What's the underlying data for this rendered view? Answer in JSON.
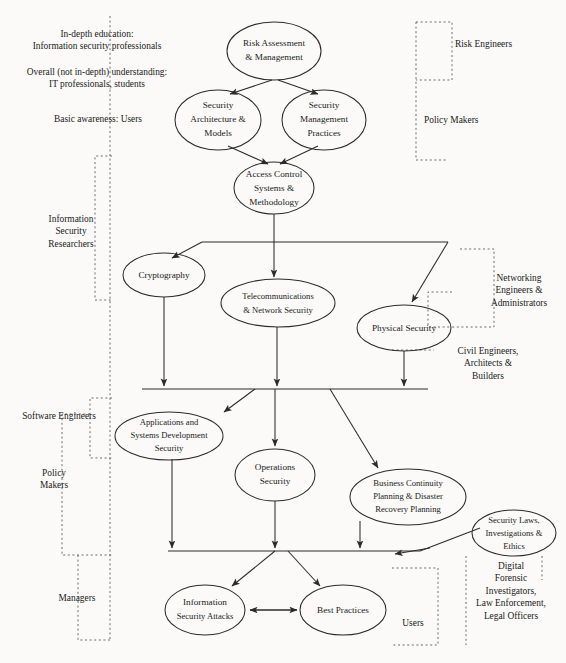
{
  "diagram": {
    "type": "directed-graph-with-audience-brackets",
    "node_fill": "#ffffff",
    "node_stroke": "#2b2b2b",
    "bracket_stroke": "#6b6b6b",
    "background": "#fbfaf8",
    "nodes": [
      {
        "id": "risk",
        "label": "Risk Assessment\n& Management",
        "cx": 274,
        "cy": 51,
        "rx": 47,
        "ry": 29
      },
      {
        "id": "arch",
        "label": "Security\nArchitecture &\nModels",
        "cx": 218,
        "cy": 120,
        "rx": 43,
        "ry": 30
      },
      {
        "id": "mgmt",
        "label": "Security\nManagement\nPractices",
        "cx": 324,
        "cy": 120,
        "rx": 42,
        "ry": 30
      },
      {
        "id": "access",
        "label": "Access Control\nSystems &\nMethodology",
        "cx": 274,
        "cy": 188,
        "rx": 40,
        "ry": 26
      },
      {
        "id": "crypto",
        "label": "Cryptography",
        "cx": 164,
        "cy": 275,
        "rx": 41,
        "ry": 22
      },
      {
        "id": "telecom",
        "label": "Telecommunications\n& Network Security",
        "cx": 278,
        "cy": 303,
        "rx": 57,
        "ry": 24
      },
      {
        "id": "physical",
        "label": "Physical Security",
        "cx": 404,
        "cy": 328,
        "rx": 47,
        "ry": 23
      },
      {
        "id": "appdev",
        "label": "Applications and\nSystems Development\nSecurity",
        "cx": 169,
        "cy": 436,
        "rx": 54,
        "ry": 24
      },
      {
        "id": "ops",
        "label": "Operations\nSecurity",
        "cx": 275,
        "cy": 475,
        "rx": 40,
        "ry": 26
      },
      {
        "id": "bcp",
        "label": "Business Continuity\nPlanning & Disaster\nRecovery Planning",
        "cx": 408,
        "cy": 497,
        "rx": 58,
        "ry": 28
      },
      {
        "id": "laws",
        "label": "Security Laws,\nInvestigations &\nEthics",
        "cx": 514,
        "cy": 533,
        "rx": 42,
        "ry": 23
      },
      {
        "id": "attacks",
        "label": "Information\nSecurity Attacks",
        "cx": 205,
        "cy": 610,
        "rx": 40,
        "ry": 25
      },
      {
        "id": "best",
        "label": "Best Practices",
        "cx": 343,
        "cy": 610,
        "rx": 43,
        "ry": 25
      }
    ],
    "audience_annotations": [
      {
        "id": "in-depth-education",
        "text": "In-depth education:\nInformation security professionals",
        "x": 8,
        "y": 28,
        "align": "ctr",
        "width": 178
      },
      {
        "id": "overall-understanding",
        "text": "Overall (not in-depth) understanding:\nIT professionals, students",
        "x": 2,
        "y": 66,
        "align": "ctr",
        "width": 190
      },
      {
        "id": "basic-awareness",
        "text": "Basic awareness: Users",
        "x": 28,
        "y": 113,
        "align": "ctr",
        "width": 140
      },
      {
        "id": "info-sec-researchers",
        "text": "Information\nSecurity\nResearchers",
        "x": 38,
        "y": 213,
        "align": "ctr",
        "width": 66
      },
      {
        "id": "software-engineers",
        "text": "Software Engineers",
        "x": 14,
        "y": 410,
        "align": "ctr",
        "width": 94
      },
      {
        "id": "policy-makers-left",
        "text": "Policy\nMakers",
        "x": 30,
        "y": 467,
        "align": "ctr",
        "width": 52
      },
      {
        "id": "managers",
        "text": "Managers",
        "x": 48,
        "y": 592,
        "align": "ctr",
        "width": 58
      },
      {
        "id": "risk-engineers",
        "text": "Risk Engineers",
        "x": 455,
        "y": 38,
        "align": "lft",
        "width": 94
      },
      {
        "id": "policy-makers-right",
        "text": "Policy Makers",
        "x": 424,
        "y": 114,
        "align": "lft",
        "width": 90
      },
      {
        "id": "networking-engineers",
        "text": "Networking\nEngineers &\nAdministrators",
        "x": 473,
        "y": 272,
        "align": "ctr",
        "width": 92
      },
      {
        "id": "civil-engineers",
        "text": "Civil Engineers,\nArchitects &\nBuilders",
        "x": 440,
        "y": 345,
        "align": "ctr",
        "width": 96
      },
      {
        "id": "users-bottom",
        "text": "Users",
        "x": 411,
        "y": 617,
        "align": "ctr",
        "width": 44
      },
      {
        "id": "digital-forensics",
        "text": "Digital\nForensic\nInvestigators,\nLaw Enforcement,\nLegal Officers",
        "x": 459,
        "y": 560,
        "align": "ctr",
        "width": 104
      }
    ],
    "edges": [
      {
        "from": "risk",
        "to": "arch"
      },
      {
        "from": "risk",
        "to": "mgmt"
      },
      {
        "from": "arch",
        "to": "access"
      },
      {
        "from": "mgmt",
        "to": "access"
      },
      {
        "from": "access",
        "to": "crypto"
      },
      {
        "from": "access",
        "to": "telecom"
      },
      {
        "from": "access",
        "to": "physical"
      },
      {
        "from": "crypto",
        "to": "appdev"
      },
      {
        "from": "telecom",
        "to": "appdev"
      },
      {
        "from": "telecom",
        "to": "ops"
      },
      {
        "from": "telecom",
        "to": "bcp"
      },
      {
        "from": "physical",
        "to": "bcp"
      },
      {
        "from": "appdev",
        "to": "attacks"
      },
      {
        "from": "ops",
        "to": "attacks"
      },
      {
        "from": "ops",
        "to": "best"
      },
      {
        "from": "bcp",
        "to": "best"
      },
      {
        "from": "laws",
        "to": "bcp"
      },
      {
        "from": "attacks",
        "to": "best",
        "bidirectional": true
      }
    ]
  }
}
